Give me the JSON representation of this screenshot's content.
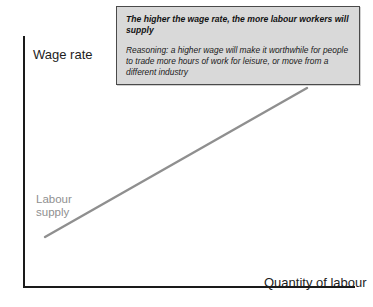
{
  "figure": {
    "kind": "labour-supply-diagram",
    "background_color": "#ffffff"
  },
  "axes": {
    "y_title": "Wage rate",
    "x_title": "Quantity of labour",
    "axis_color": "#1a1a1a"
  },
  "curve": {
    "name": "labour-supply-curve",
    "label_line1": "Labour",
    "label_line2": "supply",
    "color": "#8f8f8f",
    "stroke_width": 2.4,
    "start": {
      "x": 45,
      "y": 237
    },
    "end": {
      "x": 307,
      "y": 88
    }
  },
  "callout": {
    "headline": "The higher the wage rate, the more labour workers will supply",
    "body": "Reasoning: a higher wage will make it worthwhile for people to trade more hours of work for leisure, or move from a different industry",
    "background_color": "#d9d9d9",
    "border_color": "#4a4a4a"
  },
  "chart_data": {
    "type": "line",
    "title": "",
    "xlabel": "Quantity of labour",
    "ylabel": "Wage rate",
    "grid": false,
    "legend": "none",
    "annotations": [
      "Labour supply",
      "The higher the wage rate, the more labour workers will supply",
      "Reasoning: a higher wage will make it worthwhile for people to trade more hours of work for leisure, or move from a different industry"
    ],
    "series": [
      {
        "name": "Labour supply",
        "x": [
          0.09,
          1.0
        ],
        "y": [
          0.2,
          0.79
        ],
        "note": "Upward sloping straight line; positive relationship between wage rate and quantity of labour supplied"
      }
    ],
    "xlim": [
      0,
      1
    ],
    "ylim": [
      0,
      1
    ]
  }
}
